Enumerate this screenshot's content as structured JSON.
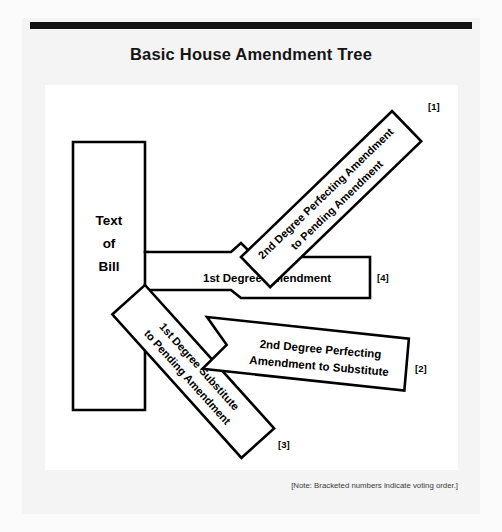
{
  "document": {
    "title": "Basic House Amendment Tree",
    "footnote": "[Note: Bracketed numbers indicate voting order.]"
  },
  "diagram": {
    "type": "amendment-tree",
    "nodes": [
      {
        "id": "text-of-bill",
        "label_lines": [
          "Text",
          "of",
          "Bill"
        ],
        "marker": "",
        "orientation": "vertical"
      },
      {
        "id": "first-degree-amendment",
        "label_lines": [
          "1st Degree Amendment"
        ],
        "marker": "[4]",
        "orientation": "horizontal"
      },
      {
        "id": "second-degree-perfecting-pending",
        "label_lines": [
          "2nd Degree Perfecting Amendment",
          "to Pending Amendment"
        ],
        "marker": "[1]",
        "orientation": "diagonal-up-right"
      },
      {
        "id": "first-degree-substitute",
        "label_lines": [
          "1st Degree Substitute",
          "to Pending Amendment"
        ],
        "marker": "[3]",
        "orientation": "diagonal-down-right"
      },
      {
        "id": "second-degree-perfecting-substitute",
        "label_lines": [
          "2nd Degree Perfecting",
          "Amendment to Substitute"
        ],
        "marker": "[2]",
        "orientation": "horizontal-tilted"
      }
    ],
    "voting_order": [
      "[1]",
      "[2]",
      "[3]",
      "[4]"
    ]
  },
  "colors": {
    "ink": "#000000",
    "rule": "#111111",
    "panel": "#ffffff",
    "card": "#f4f4f4"
  }
}
